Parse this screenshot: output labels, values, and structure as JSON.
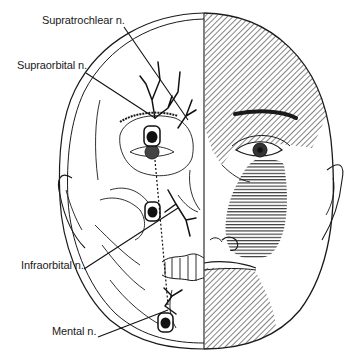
{
  "figure": {
    "labels": [
      {
        "id": "supratrochlear",
        "text": "Supratrochlear n.",
        "x": 42,
        "y": 20
      },
      {
        "id": "supraorbital",
        "text": "Supraorbital n.",
        "x": 17,
        "y": 65
      },
      {
        "id": "infraorbital",
        "text": "Infraorbital n.",
        "x": 21,
        "y": 265
      },
      {
        "id": "mental",
        "text": "Mental n.",
        "x": 52,
        "y": 331
      }
    ],
    "regions": {
      "forehead_distribution": {
        "pattern": "diagonal-hatch",
        "description": "Supraorbital / supratrochlear territory"
      },
      "cheek_distribution": {
        "pattern": "horizontal-hatch",
        "description": "Infraorbital territory"
      },
      "chin_distribution": {
        "pattern": "diagonal-hatch",
        "description": "Mental territory"
      }
    },
    "colors": {
      "ink": "#1a1a1a",
      "background": "#ffffff"
    }
  }
}
